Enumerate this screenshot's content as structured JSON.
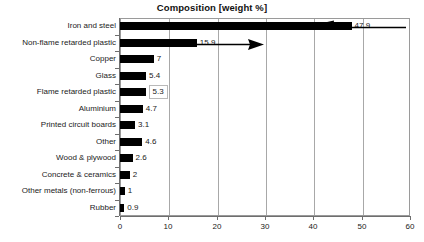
{
  "chart_data": {
    "type": "bar",
    "orientation": "horizontal",
    "title": "Composition [weight %]",
    "xlabel": "",
    "ylabel": "",
    "xlim": [
      0,
      60
    ],
    "xticks": [
      "0",
      "10",
      "20",
      "30",
      "40",
      "50",
      "60"
    ],
    "grid": true,
    "legend": false,
    "categories": [
      "Iron and steel",
      "Non-flame retarded plastic",
      "Copper",
      "Glass",
      "Flame retarded plastic",
      "Aluminium",
      "Printed circuit boards",
      "Other",
      "Wood & plywood",
      "Concrete & ceramics",
      "Other metals (non-ferrous)",
      "Rubber"
    ],
    "values": [
      47.9,
      15.9,
      7,
      5.4,
      5.3,
      4.7,
      3.1,
      4.6,
      2.6,
      2,
      1,
      0.9
    ],
    "value_labels": [
      "47.9",
      "15.9",
      "7",
      "5.4",
      "5.3",
      "4.7",
      "3.1",
      "4.6",
      "2.6",
      "2",
      "1",
      "0.9"
    ],
    "highlighted_label_index": 4,
    "bar_color": "#000000",
    "grid_color": "#a8a8a8",
    "frame_color": "#9a9a9a",
    "annotations": [
      {
        "name": "iron-and-steel-callout-arrow",
        "direction": "left",
        "target_category": "Iron and steel"
      },
      {
        "name": "non-flame-retarded-plastic-callout-arrow",
        "direction": "right",
        "target_category": "Non-flame retarded plastic"
      }
    ]
  }
}
